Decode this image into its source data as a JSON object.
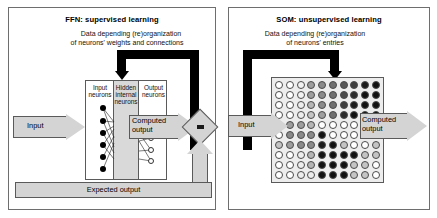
{
  "diagram": {
    "panels": [
      {
        "id": "ffn",
        "title": "FFN: supervised learning",
        "caption_line1": "Data depending (re)organization",
        "caption_line2": "of neurons' weights and connections",
        "input_label": "Input",
        "computed_output_label_line1": "Computed",
        "computed_output_label_line2": "output",
        "expected_output_label": "Expected output",
        "layers": [
          {
            "name": "input",
            "label_line1": "Input",
            "label_line2": "neurons",
            "node_count": 6,
            "node_style": "filled"
          },
          {
            "name": "hidden",
            "label_line1": "Hidden",
            "label_line2": "internal",
            "label_line3": "neurons",
            "node_count": 0,
            "node_style": "shaded-band"
          },
          {
            "name": "output",
            "label_line1": "Output",
            "label_line2": "neurons",
            "node_count": 4,
            "node_style": "open"
          }
        ],
        "comparator": {
          "name": "comparison-node",
          "symbol": "="
        }
      },
      {
        "id": "som",
        "title": "SOM: unsupervised learning",
        "caption_line1": "Data depending (re)organization",
        "caption_line2": "of neurons' entries",
        "input_label": "Input",
        "computed_output_label_line1": "Computed",
        "computed_output_label_line2": "output",
        "grid": {
          "rows": 10,
          "cols": 10,
          "shades": [
            [
              "#ffffff",
              "#ffffff",
              "#f2f2f2",
              "#9e9e9e",
              "#8a8a8a",
              "#6e6e6e",
              "#555555",
              "#3d3d3d",
              "#1a1a1a",
              "#111111"
            ],
            [
              "#ffffff",
              "#ffffff",
              "#f2f2f2",
              "#9e9e9e",
              "#8a8a8a",
              "#6e6e6e",
              "#4a4a4a",
              "#2b2b2b",
              "#111111",
              "#111111"
            ],
            [
              "#ffffff",
              "#ffffff",
              "#ededed",
              "#b5b5b5",
              "#8a8a8a",
              "#6e6e6e",
              "#3d3d3d",
              "#1a1a1a",
              "#111111",
              "#111111"
            ],
            [
              "#ffffff",
              "#ffffff",
              "#ededed",
              "#c4c4c4",
              "#9e9e9e",
              "#6e6e6e",
              "#2b2b2b",
              "#111111",
              "#111111",
              "#111111"
            ],
            [
              "#9e9e9e",
              "#9e9e9e",
              "#9e9e9e",
              "#b5b5b5",
              "#ffffff",
              "#ffffff",
              "#ffffff",
              "#ffffff",
              "#ffffff",
              "#ffffff"
            ],
            [
              "#ffffff",
              "#8a8a8a",
              "#8a8a8a",
              "#8a8a8a",
              "#111111",
              "#ffffff",
              "#ffffff",
              "#ffffff",
              "#ffffff",
              "#ffffff"
            ],
            [
              "#c4c4c4",
              "#9e9e9e",
              "#8a8a8a",
              "#8a8a8a",
              "#1a1a1a",
              "#111111",
              "#c4c4c4",
              "#ffffff",
              "#ffffff",
              "#c4c4c4"
            ],
            [
              "#ffffff",
              "#ffffff",
              "#ededed",
              "#b5b5b5",
              "#111111",
              "#111111",
              "#111111",
              "#111111",
              "#c4c4c4",
              "#c4c4c4"
            ],
            [
              "#ffffff",
              "#ffffff",
              "#ededed",
              "#b5b5b5",
              "#111111",
              "#111111",
              "#111111",
              "#c4c4c4",
              "#c4c4c4",
              "#ffffff"
            ],
            [
              "#ffffff",
              "#ffffff",
              "#ededed",
              "#ededed",
              "#111111",
              "#111111",
              "#111111",
              "#c4c4c4",
              "#c4c4c4",
              "#ffffff"
            ]
          ]
        }
      }
    ]
  }
}
